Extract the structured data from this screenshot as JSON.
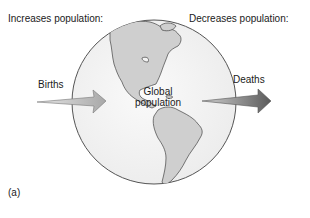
{
  "diagram": {
    "headings": {
      "increases": "Increases population:",
      "decreases": "Decreases population:"
    },
    "flows": {
      "inflow": {
        "label": "Births",
        "direction": "into globe"
      },
      "outflow": {
        "label": "Deaths",
        "direction": "out of globe"
      }
    },
    "center": {
      "line1": "Global",
      "line2": "population"
    },
    "panel_label": "(a)",
    "colors": {
      "globe_fill": "#f2f2f2",
      "land_fill": "#cfcfcf",
      "outline": "#555555",
      "arrow_births": "#b8b8b8",
      "arrow_deaths": "#7a7a7a"
    }
  }
}
